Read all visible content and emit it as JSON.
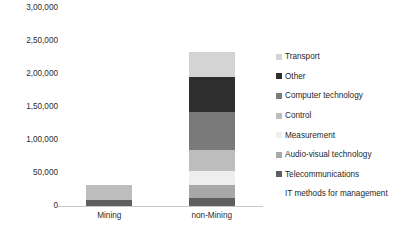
{
  "chart_data": {
    "type": "bar",
    "subtype": "stacked-vertical",
    "title": "",
    "xlabel": "",
    "ylabel": "",
    "categories": [
      "Mining",
      "non-Mining"
    ],
    "ylim": [
      0,
      300000
    ],
    "yticks": [
      0,
      50000,
      100000,
      150000,
      200000,
      250000,
      300000
    ],
    "ytick_labels": [
      "0",
      "50,000",
      "1,00,000",
      "1,50,000",
      "2,00,000",
      "2,50,000",
      "3,00,000"
    ],
    "grid": false,
    "legend_position": "right",
    "number_format": "indian",
    "series": [
      {
        "name": "IT methods for management",
        "color": "#fafafa",
        "values": [
          0,
          0
        ]
      },
      {
        "name": "Telecommunications",
        "color": "#5f5f5f",
        "values": [
          9000,
          12000
        ]
      },
      {
        "name": "Audio-visual technology",
        "color": "#a8a8a8",
        "values": [
          0,
          20000
        ]
      },
      {
        "name": "Measurement",
        "color": "#eeeeee",
        "values": [
          0,
          21000
        ]
      },
      {
        "name": "Control",
        "color": "#bdbdbd",
        "values": [
          23000,
          32000
        ]
      },
      {
        "name": "Computer technology",
        "color": "#7a7a7a",
        "values": [
          0,
          57000
        ]
      },
      {
        "name": "Other",
        "color": "#2e2e2e",
        "values": [
          0,
          54000
        ]
      },
      {
        "name": "Transport",
        "color": "#d4d4d4",
        "values": [
          0,
          38000
        ]
      }
    ],
    "totals": [
      32000,
      234000
    ]
  },
  "y_axis": {
    "ticks": [
      {
        "label": "3,00,000",
        "value": 300000
      },
      {
        "label": "2,50,000",
        "value": 250000
      },
      {
        "label": "2,00,000",
        "value": 200000
      },
      {
        "label": "1,50,000",
        "value": 150000
      },
      {
        "label": "1,00,000",
        "value": 100000
      },
      {
        "label": "50,000",
        "value": 50000
      },
      {
        "label": "0",
        "value": 0
      }
    ]
  },
  "x_axis": {
    "ticks": [
      {
        "label": "Mining"
      },
      {
        "label": "non-Mining"
      }
    ]
  },
  "legend": {
    "items": [
      {
        "label": "Transport",
        "color": "#d4d4d4"
      },
      {
        "label": "Other",
        "color": "#2e2e2e"
      },
      {
        "label": "Computer technology",
        "color": "#7a7a7a"
      },
      {
        "label": "Control",
        "color": "#bdbdbd"
      },
      {
        "label": "Measurement",
        "color": "#eeeeee"
      },
      {
        "label": "Audio-visual technology",
        "color": "#a8a8a8"
      },
      {
        "label": "Telecommunications",
        "color": "#5f5f5f"
      },
      {
        "label": "IT methods for management",
        "color": "#fcfcfc"
      }
    ]
  }
}
